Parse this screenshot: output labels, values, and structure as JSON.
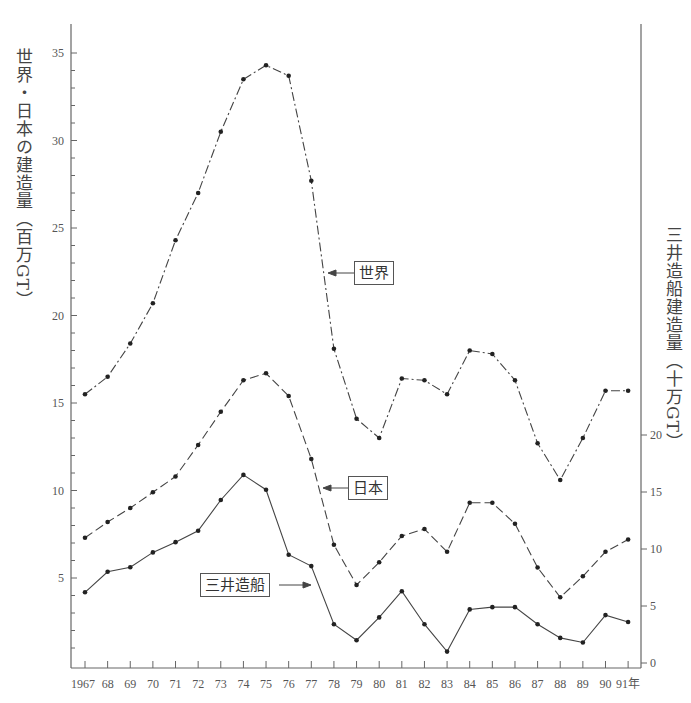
{
  "chart_data": {
    "type": "line",
    "title": "",
    "xlabel": "",
    "x_unit_suffix": "年",
    "x": [
      1967,
      1968,
      1969,
      1970,
      1971,
      1972,
      1973,
      1974,
      1975,
      1976,
      1977,
      1978,
      1979,
      1980,
      1981,
      1982,
      1983,
      1984,
      1985,
      1986,
      1987,
      1988,
      1989,
      1990,
      1991
    ],
    "x_tick_labels": [
      "1967",
      "68",
      "69",
      "70",
      "71",
      "72",
      "73",
      "74",
      "75",
      "76",
      "77",
      "78",
      "79",
      "80",
      "81",
      "82",
      "83",
      "84",
      "85",
      "86",
      "87",
      "88",
      "89",
      "90",
      "91年"
    ],
    "left_axis": {
      "label": "世界・日本の建造量（百万GT）",
      "ticks": [
        5,
        10,
        15,
        20,
        25,
        30,
        35
      ],
      "ylim": [
        0,
        36
      ],
      "minor_tick_step": 1
    },
    "right_axis": {
      "label": "三井造船建造量（十万GT）",
      "ticks": [
        0,
        5,
        10,
        15,
        20
      ],
      "ylim": [
        0,
        20
      ]
    },
    "grid": false,
    "legend": "inline callouts",
    "series": [
      {
        "name": "世界",
        "axis": "left",
        "style": "dash-dot",
        "values": [
          15.5,
          16.5,
          18.4,
          20.7,
          24.3,
          27.0,
          30.5,
          33.5,
          34.3,
          33.7,
          27.7,
          18.1,
          14.1,
          13.0,
          16.4,
          16.3,
          15.5,
          18.0,
          17.8,
          16.3,
          12.7,
          10.6,
          13.0,
          15.7,
          15.7
        ]
      },
      {
        "name": "日本",
        "axis": "left",
        "style": "dashed",
        "values": [
          7.3,
          8.2,
          9.0,
          9.9,
          10.8,
          12.6,
          14.5,
          16.3,
          16.7,
          15.4,
          11.8,
          6.9,
          4.6,
          5.9,
          7.4,
          7.8,
          6.5,
          9.3,
          9.3,
          8.1,
          5.6,
          3.9,
          5.1,
          6.5,
          7.2
        ]
      },
      {
        "name": "三井造船",
        "axis": "right",
        "style": "solid",
        "values": [
          6.2,
          8.0,
          8.4,
          9.7,
          10.6,
          11.6,
          14.3,
          16.5,
          15.2,
          9.5,
          8.5,
          3.4,
          2.0,
          4.0,
          6.3,
          3.4,
          1.0,
          4.7,
          4.9,
          4.9,
          3.4,
          2.2,
          1.8,
          4.2,
          3.6
        ]
      }
    ],
    "annotations": [
      {
        "text": "世界",
        "points_to_year": 1977
      },
      {
        "text": "日本",
        "points_to_year": 1977
      },
      {
        "text": "三井造船",
        "points_to_year": 1977
      }
    ]
  },
  "labels": {
    "left_axis": "世界・日本の建造量（百万GT）",
    "right_axis": "三井造船建造量（十万GT）",
    "callout_world": "世界",
    "callout_japan": "日本",
    "callout_mitsui": "三井造船"
  }
}
